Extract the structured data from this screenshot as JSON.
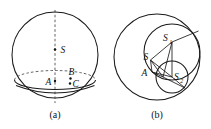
{
  "figure": {
    "background_color": "#ffffff",
    "ink_color": "#1a1a1a",
    "panels": [
      {
        "id": "a",
        "caption": "(a)",
        "description": "Sphere with center S, vertical dashed axis, horizontal small circle shown as ellipse, and points A, B, C near the lower region",
        "labels": [
          {
            "name": "S",
            "text": "S"
          },
          {
            "name": "A",
            "text": "A"
          },
          {
            "name": "B",
            "text": "B"
          },
          {
            "name": "C",
            "text": "C"
          }
        ]
      },
      {
        "id": "b",
        "caption": "(b)",
        "description": "Large circle containing a medium circle S1 and a small circle S2, with point S and point A joined by straight segments",
        "labels": [
          {
            "name": "S1",
            "text": "S",
            "sub": "1"
          },
          {
            "name": "S2",
            "text": "S",
            "sub": "2"
          },
          {
            "name": "S",
            "text": "S"
          },
          {
            "name": "A",
            "text": "A"
          }
        ]
      }
    ]
  }
}
